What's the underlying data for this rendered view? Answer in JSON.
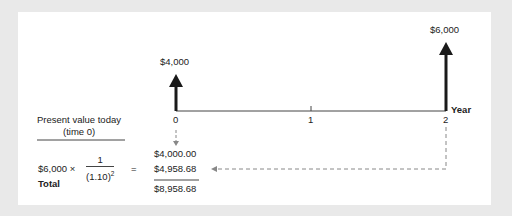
{
  "diagram": {
    "type": "cash-flow-timeline",
    "axis_label": "Year",
    "ticks": [
      "0",
      "1",
      "2"
    ],
    "cash_flows": [
      {
        "year": "0",
        "amount": "$4,000"
      },
      {
        "year": "2",
        "amount": "$6,000"
      }
    ],
    "pv_header_line1": "Present value today",
    "pv_header_line2": "(time 0)",
    "formula": {
      "lhs": "$6,000 ×",
      "numerator": "1",
      "denominator_base": "(1.10)",
      "denominator_exp": "2",
      "equals": "="
    },
    "values": {
      "pv_cf0": "$4,000.00",
      "pv_cf2": "$4,958.68",
      "total": "$8,958.68"
    },
    "total_label": "Total",
    "colors": {
      "background": "#e9e9e9",
      "panel": "#ffffff",
      "arrow": "#1a1a1a",
      "dashed": "#888888"
    }
  }
}
